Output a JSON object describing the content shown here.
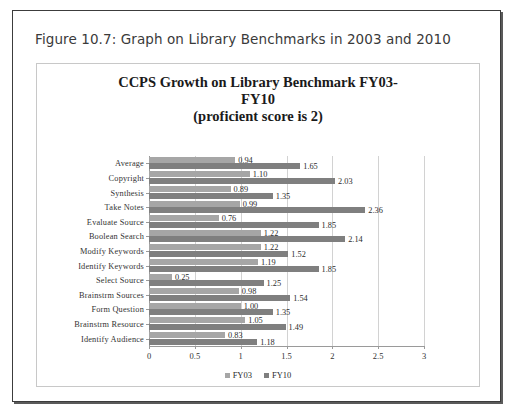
{
  "figure": {
    "caption": "Figure 10.7: Graph on Library Benchmarks in 2003 and 2010"
  },
  "chart_data": {
    "type": "bar",
    "orientation": "horizontal",
    "title": "CCPS Growth on Library Benchmark FY03-FY10 (proficient score is 2)",
    "title_lines": [
      "CCPS Growth on Library Benchmark FY03-FY10",
      "(proficient score is 2)"
    ],
    "xlabel": "",
    "ylabel": "",
    "xlim": [
      0,
      3
    ],
    "xticks": [
      "0",
      "0.5",
      "1",
      "1.5",
      "2",
      "2.5",
      "3"
    ],
    "xtick_values": [
      0,
      0.5,
      1,
      1.5,
      2,
      2.5,
      3
    ],
    "grid": true,
    "grid_axis": "x",
    "legend_position": "bottom",
    "categories": [
      "Average",
      "Copyright",
      "Synthesis",
      "Take  Notes",
      "Evaluate Source",
      "Boolean Search",
      "Modify Keywords",
      "Identify Keywords",
      "Select Source",
      "Brainstrm Sources",
      "Form Question",
      "Brainstrm Resource",
      "Identify Audience"
    ],
    "series": [
      {
        "name": "FY03",
        "color": "#a6a6a6",
        "values": [
          0.94,
          1.1,
          0.89,
          0.99,
          0.76,
          1.22,
          1.22,
          1.19,
          0.25,
          0.98,
          1.0,
          1.05,
          0.83
        ],
        "labels": [
          "0.94",
          "1.10",
          "0.89",
          "0.99",
          "0.76",
          "1.22",
          "1.22",
          "1.19",
          "0.25",
          "0.98",
          "1.00",
          "1.05",
          "0.83"
        ]
      },
      {
        "name": "FY10",
        "color": "#7f7f7f",
        "values": [
          1.65,
          2.03,
          1.35,
          2.36,
          1.85,
          2.14,
          1.52,
          1.85,
          1.25,
          1.54,
          1.35,
          1.49,
          1.18
        ],
        "labels": [
          "1.65",
          "2.03",
          "1.35",
          "2.36",
          "1.85",
          "2.14",
          "1.52",
          "1.85",
          "1.25",
          "1.54",
          "1.35",
          "1.49",
          "1.18"
        ]
      }
    ]
  }
}
